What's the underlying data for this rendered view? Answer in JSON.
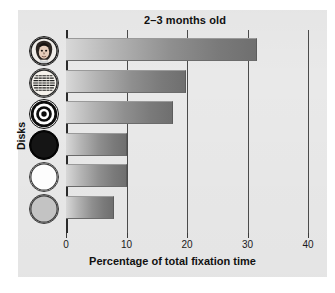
{
  "chart": {
    "title": "2–3 months old",
    "xlabel": "Percentage of total fixation time",
    "ylabel": "Disks"
  },
  "chart_data": {
    "type": "bar",
    "orientation": "horizontal",
    "title": "2–3 months old",
    "xlabel": "Percentage of total fixation time",
    "ylabel": "Disks",
    "xlim": [
      0,
      40
    ],
    "xticks": [
      0,
      10,
      20,
      30,
      40
    ],
    "xticklabels": [
      "0",
      "10",
      "20",
      "30",
      "40"
    ],
    "grid": true,
    "legend": null,
    "categories": [
      "face",
      "printed text",
      "bullseye",
      "black disk",
      "white disk",
      "gray disk"
    ],
    "values": [
      31.5,
      19.8,
      17.7,
      10.0,
      10.0,
      8.0
    ],
    "bars": [
      {
        "icon": "face-disk-icon",
        "label": "face",
        "value": 31.5
      },
      {
        "icon": "text-disk-icon",
        "label": "printed text",
        "value": 19.8
      },
      {
        "icon": "bullseye-disk-icon",
        "label": "bullseye",
        "value": 17.7
      },
      {
        "icon": "black-disk-icon",
        "label": "black disk",
        "value": 10.0
      },
      {
        "icon": "white-disk-icon",
        "label": "white disk",
        "value": 10.0
      },
      {
        "icon": "gray-disk-icon",
        "label": "gray disk",
        "value": 8.0
      }
    ]
  },
  "colors": {
    "panel": "#e9e9e9",
    "bar_light": "#d8d8d8",
    "bar_dark": "#6f6f6f",
    "axis": "#2b2b2b",
    "text": "#111111"
  }
}
